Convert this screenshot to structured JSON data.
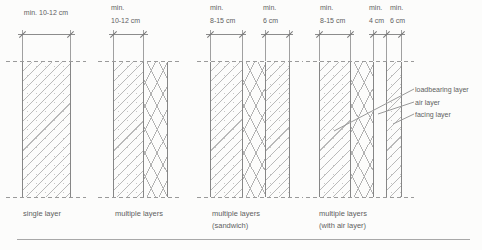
{
  "figure": {
    "walls": [
      {
        "caption": [
          "single layer"
        ],
        "dims": [
          {
            "lines": [
              "min. 10-12 cm"
            ]
          }
        ],
        "layers": [
          "loadbearing"
        ]
      },
      {
        "caption": [
          "multiple layers"
        ],
        "dims": [
          {
            "lines": [
              "min.",
              "10-12 cm"
            ]
          }
        ],
        "layers": [
          "loadbearing",
          "insulation"
        ]
      },
      {
        "caption": [
          "multiple layers",
          "(sandwich)"
        ],
        "dims": [
          {
            "lines": [
              "min.",
              "8-15 cm"
            ]
          },
          {
            "lines": [
              "min.",
              "6 cm"
            ]
          }
        ],
        "layers": [
          "loadbearing",
          "insulation",
          "facing"
        ]
      },
      {
        "caption": [
          "multiple layers",
          "(with air layer)"
        ],
        "dims": [
          {
            "lines": [
              "min.",
              "8-15 cm"
            ]
          },
          {
            "lines": [
              "min.",
              "4 cm"
            ]
          },
          {
            "lines": [
              "min.",
              "6 cm"
            ]
          }
        ],
        "layers": [
          "loadbearing",
          "insulation",
          "air",
          "facing"
        ]
      }
    ],
    "layer_labels": {
      "loadbearing": "loadbearing layer",
      "air": "air layer",
      "facing": "facing layer"
    },
    "colors": {
      "line": "#8c8c8c",
      "hatch": "#b9b9b9",
      "text": "#5f5f5f",
      "background": "#fcfcfb"
    }
  }
}
